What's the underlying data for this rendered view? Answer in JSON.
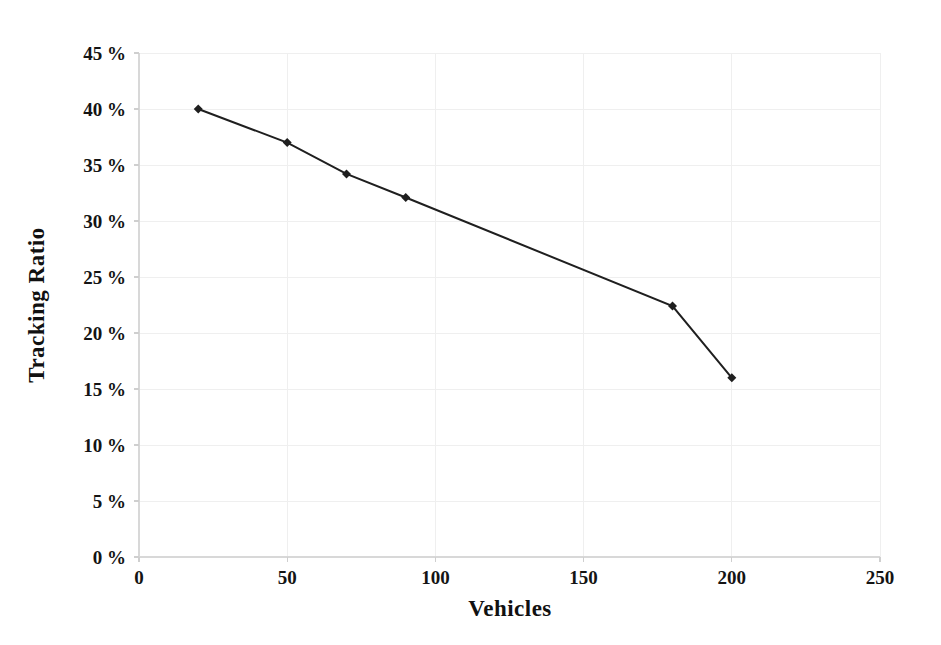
{
  "chart_data": {
    "type": "line",
    "title": "",
    "xlabel": "Vehicles",
    "ylabel": "Tracking Ratio",
    "xlim": [
      0,
      250
    ],
    "ylim": [
      0,
      45
    ],
    "xticks": [
      0,
      50,
      100,
      150,
      200,
      250
    ],
    "xtick_labels": [
      "0",
      "50",
      "100",
      "150",
      "200",
      "250"
    ],
    "yticks": [
      0,
      5,
      10,
      15,
      20,
      25,
      30,
      35,
      40,
      45
    ],
    "ytick_labels": [
      "0%",
      "5%",
      "10%",
      "15%",
      "20%",
      "25%",
      "30%",
      "35%",
      "40%",
      "45%"
    ],
    "grid": true,
    "legend": false,
    "series": [
      {
        "name": "Tracking Ratio",
        "marker": "diamond",
        "color": "#1f1f1f",
        "line_width": 2,
        "marker_size": 9,
        "x": [
          20,
          50,
          70,
          90,
          180,
          200
        ],
        "y": [
          40.0,
          37.0,
          34.2,
          32.1,
          22.4,
          16.0
        ],
        "points": [
          {
            "x": 20,
            "y": 40.0,
            "label": "40%"
          },
          {
            "x": 50,
            "y": 37.0,
            "label": "37%"
          },
          {
            "x": 70,
            "y": 34.2,
            "label": "34.2%"
          },
          {
            "x": 90,
            "y": 32.1,
            "label": "32.1%"
          },
          {
            "x": 180,
            "y": 22.4,
            "label": "22.4%"
          },
          {
            "x": 200,
            "y": 16.0,
            "label": "16%"
          }
        ]
      }
    ]
  },
  "colors": {
    "background": "#ffffff",
    "series": "#1f1f1f",
    "grid": "#efefef",
    "axis": "#d8d8d8",
    "text": "#141414"
  },
  "axes": {
    "x_title": "Vehicles",
    "y_title": "Tracking Ratio",
    "x_labels": [
      "0",
      "50",
      "100",
      "150",
      "200",
      "250"
    ],
    "y_labels": [
      "45 %",
      "40 %",
      "35 %",
      "30 %",
      "25 %",
      "20 %",
      "15 %",
      "10 %",
      "5 %",
      "0 %"
    ]
  }
}
